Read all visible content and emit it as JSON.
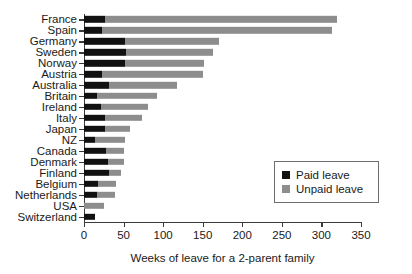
{
  "chart_data": {
    "type": "bar",
    "orientation": "horizontal",
    "stacked": true,
    "title": "",
    "xlabel": "Weeks of leave for a 2-parent family",
    "ylabel": "",
    "xlim": [
      0,
      350
    ],
    "xticks": [
      "0",
      "50",
      "100",
      "150",
      "200",
      "250",
      "300",
      "350"
    ],
    "grid": false,
    "legend_position": "center-right",
    "categories": [
      "France",
      "Spain",
      "Germany",
      "Sweden",
      "Norway",
      "Austria",
      "Australia",
      "Britain",
      "Ireland",
      "Italy",
      "Japan",
      "NZ",
      "Canada",
      "Denmark",
      "Finland",
      "Belgium",
      "Netherlands",
      "USA",
      "Switzerland"
    ],
    "series": [
      {
        "name": "Paid leave",
        "color": "#111111",
        "values": [
          27,
          23,
          52,
          53,
          52,
          23,
          31,
          17,
          22,
          26,
          26,
          14,
          28,
          30,
          32,
          18,
          16,
          0,
          14
        ]
      },
      {
        "name": "Unpaid leave",
        "color": "#8d8d8d",
        "values": [
          293,
          291,
          118,
          110,
          100,
          128,
          87,
          75,
          59,
          47,
          32,
          38,
          23,
          21,
          15,
          23,
          23,
          25,
          0
        ]
      }
    ],
    "totals": [
      320,
      314,
      170,
      163,
      152,
      151,
      118,
      92,
      81,
      73,
      58,
      52,
      51,
      51,
      47,
      41,
      39,
      25,
      14
    ]
  },
  "legend": {
    "items": [
      {
        "label": "Paid leave",
        "color": "#111111"
      },
      {
        "label": "Unpaid leave",
        "color": "#8d8d8d"
      }
    ]
  }
}
